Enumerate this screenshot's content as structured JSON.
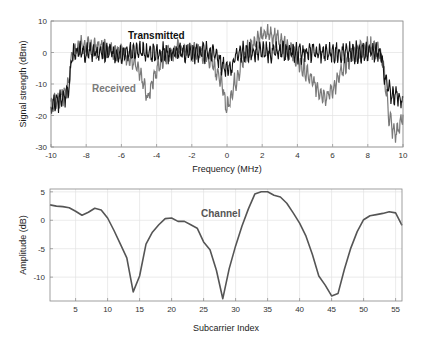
{
  "chart_data": [
    {
      "type": "line",
      "title": "",
      "xlabel": "Frequency (MHz)",
      "ylabel": "Signal strength (dBm)",
      "xlim": [
        -10,
        10
      ],
      "ylim": [
        -30,
        10
      ],
      "xticks": [
        -10,
        -8,
        -6,
        -4,
        -2,
        0,
        2,
        4,
        6,
        8,
        10
      ],
      "yticks": [
        10,
        0,
        -10,
        -20,
        -30
      ],
      "grid": true,
      "annotations": [
        {
          "text": "Transmitted",
          "x": -2.6,
          "y": 2.5,
          "color": "#111111"
        },
        {
          "text": "Received",
          "x": -7.6,
          "y": -12,
          "color": "#7a7a7a"
        }
      ],
      "series": [
        {
          "name": "Transmitted",
          "color": "#111111",
          "envelope_x": [
            -10,
            -9.2,
            -9.0,
            -8.8,
            -8.6,
            -6,
            -4,
            -2,
            -0.6,
            -0.3,
            0,
            0.3,
            0.6,
            2,
            4,
            6,
            8,
            8.6,
            8.8,
            9.0,
            9.3,
            10
          ],
          "envelope_y": [
            -17,
            -14,
            -11,
            -1,
            0,
            0,
            0,
            0,
            0,
            -4,
            -6,
            -4,
            0,
            0,
            0,
            0,
            0,
            0,
            -2,
            -9,
            -13,
            -15
          ],
          "ripple_db": 2.5
        },
        {
          "name": "Received",
          "color": "#7a7a7a",
          "envelope_x": [
            -10,
            -9.2,
            -9.0,
            -8.8,
            -8.4,
            -7,
            -5.8,
            -5.2,
            -4.8,
            -4.5,
            -4.2,
            -3.5,
            -2.5,
            -1.5,
            -0.8,
            -0.3,
            0,
            0.3,
            0.8,
            1.2,
            1.8,
            2.4,
            3.0,
            3.6,
            4.2,
            4.8,
            5.4,
            5.7,
            6.2,
            6.8,
            7.4,
            8,
            8.6,
            8.9,
            9.2,
            9.5,
            9.8,
            10
          ],
          "envelope_y": [
            -17,
            -13,
            -10,
            0,
            2,
            1.5,
            0,
            -4,
            -9,
            -15,
            -8,
            0,
            1,
            0,
            -3,
            -10,
            -18,
            -12,
            -4,
            1,
            5,
            6,
            4,
            1,
            -4,
            -9,
            -13,
            -14,
            -10,
            -3,
            1,
            1.5,
            1,
            -5,
            -20,
            -26,
            -24,
            -19
          ],
          "ripple_db": 2.5
        }
      ]
    },
    {
      "type": "line",
      "title": "",
      "xlabel": "Subcarrier Index",
      "ylabel": "Amplitude (dB)",
      "xlim": [
        1,
        56
      ],
      "ylim": [
        -14.2,
        5.5
      ],
      "xticks": [
        5,
        10,
        15,
        20,
        25,
        30,
        35,
        40,
        45,
        50,
        55
      ],
      "yticks": [
        5,
        0,
        -5,
        -10
      ],
      "grid": true,
      "annotations": [
        {
          "text": "Channel",
          "x": 27,
          "y": 3
        }
      ],
      "series": [
        {
          "name": "Channel",
          "color": "#555555",
          "x": [
            1,
            2,
            3,
            4,
            5,
            6,
            7,
            8,
            9,
            10,
            11,
            12,
            13,
            14,
            15,
            16,
            17,
            18,
            19,
            20,
            21,
            22,
            23,
            24,
            25,
            26,
            27,
            28,
            29,
            30,
            31,
            32,
            33,
            34,
            35,
            36,
            37,
            38,
            39,
            40,
            41,
            42,
            43,
            44,
            45,
            46,
            47,
            48,
            49,
            50,
            51,
            52,
            53,
            54,
            55,
            56
          ],
          "values": [
            2.7,
            2.5,
            2.4,
            2.2,
            1.6,
            0.9,
            1.4,
            2.1,
            1.8,
            0.4,
            -1.8,
            -4.2,
            -6.6,
            -12.6,
            -9.8,
            -4.2,
            -2.1,
            -0.8,
            0.3,
            0.4,
            -0.2,
            -0.2,
            -0.8,
            -1.4,
            -3.8,
            -5.2,
            -8.8,
            -13.8,
            -8.5,
            -4.5,
            -1.0,
            2.0,
            4.6,
            5.0,
            5.0,
            4.4,
            4.1,
            3.0,
            1.3,
            -0.5,
            -2.8,
            -6.0,
            -9.8,
            -11.4,
            -13.3,
            -12.9,
            -8.6,
            -4.9,
            -2.0,
            0.1,
            0.8,
            1.0,
            1.2,
            1.5,
            1.3,
            -0.9
          ]
        }
      ]
    }
  ],
  "top_plot": {
    "xlabel": "Frequency (MHz)",
    "ylabel": "Signal strength (dBm)",
    "legend_tx": "Transmitted",
    "legend_rx": "Received"
  },
  "bottom_plot": {
    "xlabel": "Subcarrier Index",
    "ylabel": "Amplitude (dB)",
    "legend_channel": "Channel"
  }
}
